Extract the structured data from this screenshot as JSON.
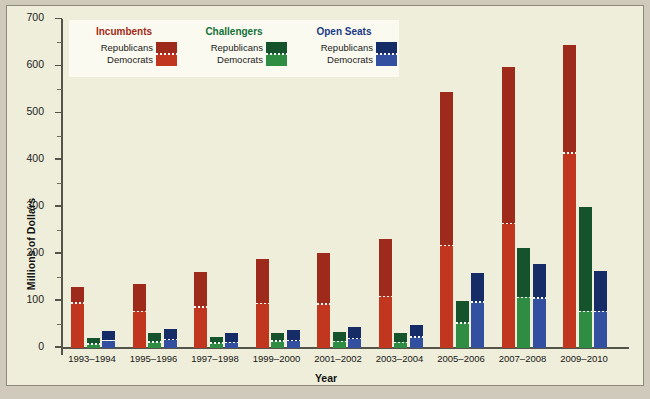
{
  "legend": {
    "columns": [
      {
        "title": "Incumbents",
        "title_color": "#a32a17",
        "rep_label": "Republicans",
        "dem_label": "Democrats",
        "rep_color": "#9e2a1c",
        "dem_color": "#c0361f"
      },
      {
        "title": "Challengers",
        "title_color": "#14713a",
        "rep_label": "Republicans",
        "dem_label": "Democrats",
        "rep_color": "#14532b",
        "dem_color": "#2f8c43"
      },
      {
        "title": "Open Seats",
        "title_color": "#1b3a86",
        "rep_label": "Republicans",
        "dem_label": "Democrats",
        "rep_color": "#152c66",
        "dem_color": "#3350a0"
      }
    ]
  },
  "chart_data": {
    "type": "bar",
    "title": "",
    "xlabel": "Year",
    "ylabel": "Millions of Dollars",
    "ylim": [
      0,
      700
    ],
    "ytick_step": 100,
    "yticks": [
      0,
      100,
      200,
      300,
      400,
      500,
      600,
      700
    ],
    "ytick_labels": [
      "0",
      "100",
      "200",
      "300",
      "400",
      "500",
      "600",
      "700"
    ],
    "grid": false,
    "legend_position": "top-left-inside",
    "stacked": true,
    "categories": [
      "1993–1994",
      "1995–1996",
      "1997–1998",
      "1999–2000",
      "2001–2002",
      "2003–2004",
      "2005–2006",
      "2007–2008",
      "2009–2010"
    ],
    "series": [
      {
        "name": "Incumbents – Democrats",
        "group": "Incumbents",
        "party": "Democrats",
        "color": "#c0361f",
        "values": [
          96,
          78,
          87,
          95,
          94,
          110,
          218,
          265,
          415
        ]
      },
      {
        "name": "Incumbents – Republicans",
        "group": "Incumbents",
        "party": "Republicans",
        "color": "#9e2a1c",
        "values": [
          34,
          59,
          75,
          95,
          108,
          123,
          327,
          333,
          230
        ]
      },
      {
        "name": "Challengers – Democrats",
        "group": "Challengers",
        "party": "Democrats",
        "color": "#2f8c43",
        "values": [
          9,
          13,
          11,
          15,
          14,
          12,
          53,
          108,
          78
        ]
      },
      {
        "name": "Challengers – Republicans",
        "group": "Challengers",
        "party": "Republicans",
        "color": "#14532b",
        "values": [
          12,
          18,
          13,
          16,
          20,
          20,
          47,
          105,
          222
        ]
      },
      {
        "name": "Open Seats – Democrats",
        "group": "Open Seats",
        "party": "Democrats",
        "color": "#3350a0",
        "values": [
          16,
          18,
          12,
          16,
          20,
          23,
          98,
          106,
          78
        ]
      },
      {
        "name": "Open Seats – Republicans",
        "group": "Open Seats",
        "party": "Republicans",
        "color": "#152c66",
        "values": [
          20,
          23,
          19,
          22,
          25,
          26,
          62,
          74,
          86
        ]
      }
    ],
    "totals": {
      "Incumbents": [
        130,
        137,
        162,
        190,
        202,
        233,
        545,
        598,
        645
      ],
      "Challengers": [
        21,
        31,
        24,
        31,
        34,
        32,
        100,
        213,
        300
      ],
      "Open Seats": [
        36,
        41,
        31,
        38,
        45,
        49,
        160,
        180,
        164
      ]
    }
  }
}
